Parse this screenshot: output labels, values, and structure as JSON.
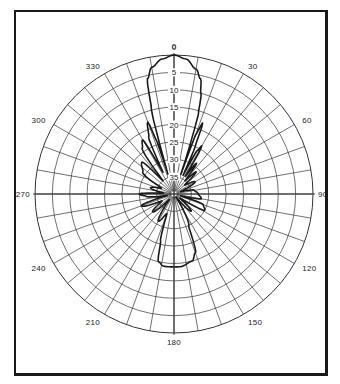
{
  "chart_data": {
    "type": "polar",
    "title": "",
    "angle_unit": "degrees",
    "angle_direction": "clockwise",
    "zero_location": "top",
    "angle_ticks": [
      0,
      30,
      60,
      90,
      120,
      150,
      180,
      210,
      240,
      270,
      300,
      330
    ],
    "angle_tick_labels": [
      "0",
      "30",
      "60",
      "90",
      "120",
      "150",
      "180",
      "210",
      "240",
      "270",
      "300",
      "330"
    ],
    "radial_gridline_step_deg": 10,
    "radial_unit": "dB below peak",
    "radial_range": [
      0,
      40
    ],
    "ring_ticks": [
      0,
      5,
      10,
      15,
      20,
      25,
      30,
      35
    ],
    "ring_tick_labels": [
      "0",
      "5",
      "10",
      "15",
      "20",
      "25",
      "30",
      "35"
    ],
    "grid": true,
    "legend": null,
    "series": [
      {
        "name": "radiation pattern",
        "angles": [
          0,
          5,
          10,
          13,
          15,
          17,
          18,
          19,
          20,
          22,
          24,
          26,
          28,
          30,
          33,
          36,
          40,
          45,
          50,
          60,
          70,
          80,
          90,
          100,
          105,
          110,
          118,
          125,
          135,
          145,
          155,
          160,
          165,
          175,
          180,
          188,
          193,
          196,
          200,
          210,
          220,
          230,
          240,
          250,
          258,
          265,
          270,
          275,
          285,
          295,
          305,
          315,
          320,
          325,
          330,
          333,
          336,
          340,
          342,
          343,
          345,
          347,
          350,
          355
        ],
        "values_db": [
          0,
          -1,
          -3.5,
          -6,
          -10,
          -16,
          -25,
          -34,
          -22,
          -18,
          -25,
          -34,
          -26,
          -24,
          -34,
          -29,
          -35,
          -31,
          -36,
          -33,
          -38,
          -34,
          -33,
          -32,
          -38,
          -31,
          -30,
          -38,
          -33,
          -39,
          -30,
          -22,
          -20,
          -19,
          -19,
          -19,
          -20,
          -26,
          -34,
          -31,
          -38,
          -32,
          -36,
          -30,
          -38,
          -32,
          -30,
          -37,
          -33,
          -36,
          -29,
          -27,
          -35,
          -24,
          -22,
          -33,
          -22,
          -18,
          -24,
          -34,
          -15,
          -6,
          -3,
          -1
        ]
      }
    ]
  },
  "figure": {
    "stroke_color": "#1a1a1a",
    "grid_color": "#333333",
    "background": "#ffffff"
  }
}
